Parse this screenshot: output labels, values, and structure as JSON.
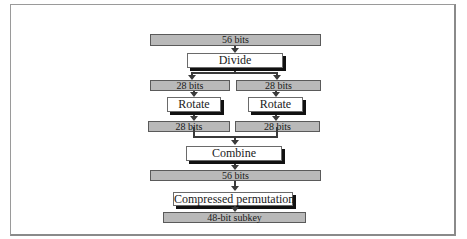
{
  "diagram": {
    "type": "flowchart",
    "title": "",
    "nodes": {
      "input_56": {
        "label": "56 bits",
        "kind": "data"
      },
      "divide": {
        "label": "Divide",
        "kind": "process"
      },
      "left_28_a": {
        "label": "28 bits",
        "kind": "data"
      },
      "right_28_a": {
        "label": "28 bits",
        "kind": "data"
      },
      "rotate_left": {
        "label": "Rotate",
        "kind": "process"
      },
      "rotate_right": {
        "label": "Rotate",
        "kind": "process"
      },
      "left_28_b": {
        "label": "28 bits",
        "kind": "data"
      },
      "right_28_b": {
        "label": "28 bits",
        "kind": "data"
      },
      "combine": {
        "label": "Combine",
        "kind": "process"
      },
      "output_56": {
        "label": "56 bits",
        "kind": "data"
      },
      "compress": {
        "label": "Compressed permutation",
        "kind": "process"
      },
      "subkey": {
        "label": "48-bit subkey",
        "kind": "data"
      }
    },
    "edges": [
      [
        "input_56",
        "divide"
      ],
      [
        "divide",
        "left_28_a"
      ],
      [
        "divide",
        "right_28_a"
      ],
      [
        "left_28_a",
        "rotate_left"
      ],
      [
        "right_28_a",
        "rotate_right"
      ],
      [
        "rotate_left",
        "left_28_b"
      ],
      [
        "rotate_right",
        "right_28_b"
      ],
      [
        "left_28_b",
        "combine"
      ],
      [
        "right_28_b",
        "combine"
      ],
      [
        "combine",
        "output_56"
      ],
      [
        "output_56",
        "compress"
      ],
      [
        "compress",
        "subkey"
      ]
    ]
  },
  "colors": {
    "data_fill": "#b9b9b9",
    "process_fill": "#ffffff",
    "shadow": "#111111",
    "line": "#3a3a3a"
  }
}
